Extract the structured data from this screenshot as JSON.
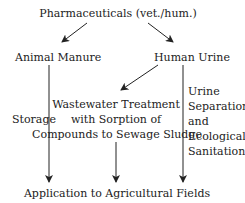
{
  "nodes": {
    "source": "Pharmaceuticals (vet./hum.)",
    "animal_manure": "Animal Manure",
    "human_urine": "Human Urine",
    "wastewater": [
      "Wastewater Treatment",
      "with Sorption of",
      "Compounds to Sewage Sludge"
    ],
    "destination": "Application to Agricultural Fields"
  },
  "edge_labels": {
    "storage": "Storage",
    "urine_separation": [
      "Urine",
      "Separation",
      "and",
      "Ecological",
      "Sanitation"
    ]
  },
  "colors": {
    "line": "#222222",
    "text": "#222222",
    "background": "#ffffff"
  }
}
